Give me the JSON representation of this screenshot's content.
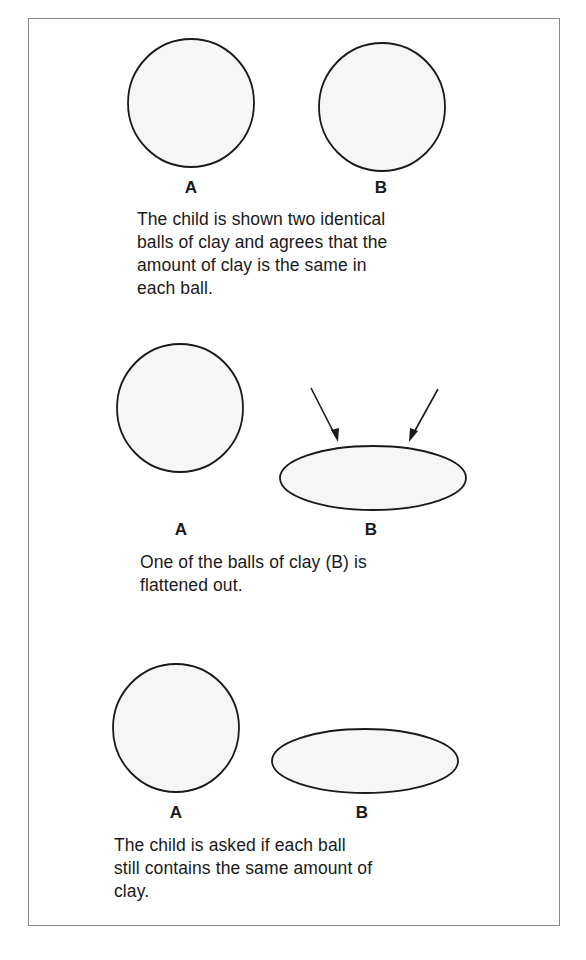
{
  "panels": [
    {
      "label_a": "A",
      "label_b": "B",
      "caption": [
        "The child is shown two identical",
        "balls of clay and agrees that the",
        "amount of clay is the same in",
        "each ball."
      ]
    },
    {
      "label_a": "A",
      "label_b": "B",
      "caption": [
        "One of the balls of clay (B) is",
        "flattened out."
      ]
    },
    {
      "label_a": "A",
      "label_b": "B",
      "caption": [
        "The child is asked if each ball",
        "still contains the same amount of",
        "clay."
      ]
    }
  ],
  "colors": {
    "frame": "#8a8a8a",
    "stroke": "#1a1a1a",
    "fill": "#f6f6f6"
  }
}
